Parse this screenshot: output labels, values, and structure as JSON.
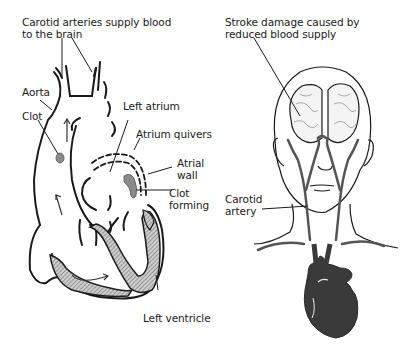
{
  "heart_panel": {
    "labels": {
      "carotid_line1": "Carotid arteries supply blood",
      "carotid_line2": "to the brain",
      "aorta": "Aorta",
      "clot": "Clot",
      "left_atrium": "Left atrium",
      "atrium_quivers": "Atrium quivers",
      "atrial_wall_line1": "Atrial",
      "atrial_wall_line2": "wall",
      "clot_forming_line1": "Clot",
      "clot_forming_line2": "forming",
      "left_ventricle": "Left ventricle"
    }
  },
  "body_panel": {
    "labels": {
      "stroke_line1": "Stroke damage caused by",
      "stroke_line2": "reduced blood supply",
      "carotid_artery_line1": "Carotid",
      "carotid_artery_line2": "artery"
    }
  },
  "colors": {
    "ink": "#1a1a1a",
    "vessel": "#555555",
    "heart_fill": "#3a3a3a",
    "clot": "#8a8a8a",
    "hatch": "#9a9a9a"
  }
}
